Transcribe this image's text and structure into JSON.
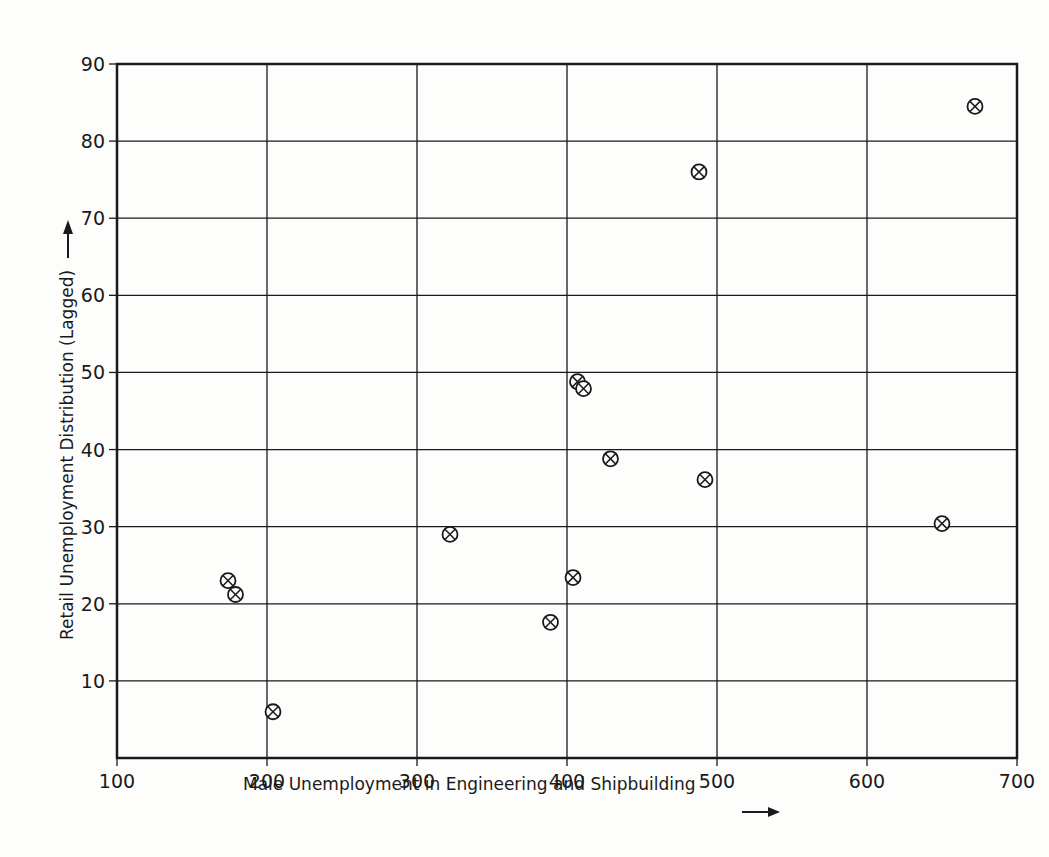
{
  "chart_data": {
    "type": "scatter",
    "title": "",
    "xlabel": "Male Unemployment in Engineering and Shipbuilding",
    "ylabel": "Retail Unemployment Distribution (Lagged)",
    "xlim": [
      100,
      700
    ],
    "ylim": [
      0,
      90
    ],
    "xticks": [
      100,
      200,
      300,
      400,
      500,
      600,
      700
    ],
    "yticks": [
      10,
      20,
      30,
      40,
      50,
      60,
      70,
      80,
      90
    ],
    "grid": true,
    "marker": "circled-x",
    "legend": null,
    "points": [
      {
        "x": 672,
        "y": 84.5
      },
      {
        "x": 488,
        "y": 76.0
      },
      {
        "x": 407,
        "y": 48.8
      },
      {
        "x": 411,
        "y": 47.9
      },
      {
        "x": 429,
        "y": 38.8
      },
      {
        "x": 492,
        "y": 36.1
      },
      {
        "x": 650,
        "y": 30.4
      },
      {
        "x": 322,
        "y": 29.0
      },
      {
        "x": 404,
        "y": 23.4
      },
      {
        "x": 174,
        "y": 23.0
      },
      {
        "x": 179,
        "y": 21.2
      },
      {
        "x": 389,
        "y": 17.6
      },
      {
        "x": 204,
        "y": 6.0
      }
    ]
  },
  "colors": {
    "ink": "#1a1a1a",
    "paper": "#fdfdfc"
  }
}
